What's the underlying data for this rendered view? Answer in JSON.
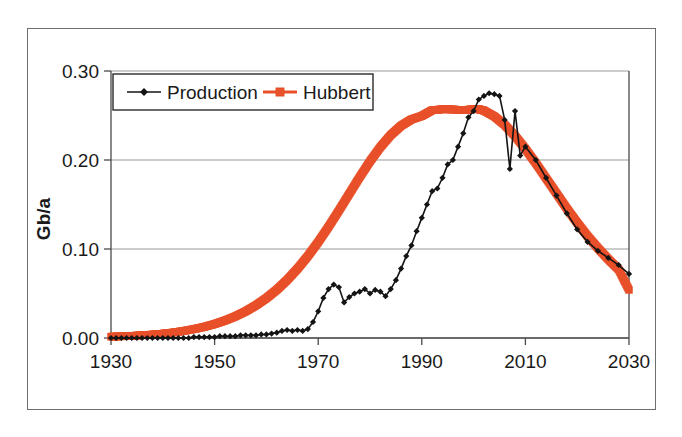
{
  "chart_data": {
    "type": "line",
    "title": "",
    "xlabel": "",
    "ylabel": "Gb/a",
    "xlim": [
      1930,
      2030
    ],
    "ylim": [
      0.0,
      0.3
    ],
    "grid": true,
    "legend_position": "top-left-inside",
    "x_ticks": [
      "1930",
      "1950",
      "1970",
      "1990",
      "2010",
      "2030"
    ],
    "x_tick_values": [
      1930,
      1950,
      1970,
      1990,
      2010,
      2030
    ],
    "y_ticks": [
      "0.00",
      "0.10",
      "0.20",
      "0.30"
    ],
    "y_tick_values": [
      0.0,
      0.1,
      0.2,
      0.3
    ],
    "colors": {
      "production": "#141414",
      "hubbert": "#e8502a",
      "grid": "#9a9a9a",
      "axis": "#4a4a4a",
      "frame": "#6e6e6e"
    },
    "series": [
      {
        "name": "Production",
        "marker": "diamond",
        "color": "#141414",
        "x": [
          1930,
          1931,
          1932,
          1933,
          1934,
          1935,
          1936,
          1937,
          1938,
          1939,
          1940,
          1941,
          1942,
          1943,
          1944,
          1945,
          1946,
          1947,
          1948,
          1949,
          1950,
          1951,
          1952,
          1953,
          1954,
          1955,
          1956,
          1957,
          1958,
          1959,
          1960,
          1961,
          1962,
          1963,
          1964,
          1965,
          1966,
          1967,
          1968,
          1969,
          1970,
          1971,
          1972,
          1973,
          1974,
          1975,
          1976,
          1977,
          1978,
          1979,
          1980,
          1981,
          1982,
          1983,
          1984,
          1985,
          1986,
          1987,
          1988,
          1989,
          1990,
          1991,
          1992,
          1993,
          1994,
          1995,
          1996,
          1997,
          1998,
          1999,
          2000,
          2001,
          2002,
          2003,
          2004,
          2005,
          2006,
          2007,
          2008,
          2009,
          2010,
          2012,
          2014,
          2016,
          2018,
          2020,
          2022,
          2024,
          2026,
          2028,
          2030
        ],
        "values": [
          0.0,
          0.0,
          0.0,
          0.0,
          0.0,
          0.0,
          0.0,
          0.0,
          0.0,
          0.0,
          0.0,
          0.0,
          0.0,
          0.0,
          0.0,
          0.0,
          0.001,
          0.001,
          0.001,
          0.001,
          0.001,
          0.002,
          0.002,
          0.002,
          0.002,
          0.003,
          0.003,
          0.003,
          0.003,
          0.004,
          0.004,
          0.005,
          0.006,
          0.008,
          0.009,
          0.008,
          0.009,
          0.008,
          0.01,
          0.018,
          0.03,
          0.045,
          0.055,
          0.06,
          0.057,
          0.04,
          0.046,
          0.05,
          0.052,
          0.055,
          0.05,
          0.054,
          0.052,
          0.047,
          0.055,
          0.065,
          0.078,
          0.092,
          0.104,
          0.12,
          0.135,
          0.15,
          0.165,
          0.168,
          0.18,
          0.195,
          0.2,
          0.215,
          0.23,
          0.248,
          0.255,
          0.268,
          0.272,
          0.275,
          0.274,
          0.272,
          0.245,
          0.19,
          0.255,
          0.205,
          0.215,
          0.2,
          0.18,
          0.16,
          0.14,
          0.122,
          0.108,
          0.098,
          0.09,
          0.082,
          0.072
        ]
      },
      {
        "name": "Hubbert",
        "marker": "square",
        "color": "#e8502a",
        "x": [
          1930,
          1932,
          1934,
          1936,
          1938,
          1940,
          1942,
          1944,
          1946,
          1948,
          1950,
          1952,
          1954,
          1956,
          1958,
          1960,
          1962,
          1964,
          1966,
          1968,
          1970,
          1972,
          1974,
          1976,
          1978,
          1980,
          1982,
          1984,
          1986,
          1988,
          1990,
          1992,
          1994,
          1996,
          1998,
          2000,
          2001,
          2002,
          2004,
          2006,
          2008,
          2010,
          2012,
          2014,
          2016,
          2018,
          2020,
          2022,
          2024,
          2026,
          2028,
          2030
        ],
        "values": [
          0.0015,
          0.0019,
          0.0024,
          0.0031,
          0.0039,
          0.0049,
          0.0062,
          0.0079,
          0.01,
          0.0125,
          0.0157,
          0.0196,
          0.0243,
          0.03,
          0.0368,
          0.0448,
          0.0542,
          0.0652,
          0.0778,
          0.092,
          0.1078,
          0.125,
          0.1432,
          0.162,
          0.1807,
          0.1985,
          0.2145,
          0.228,
          0.2385,
          0.2456,
          0.2495,
          0.256,
          0.257,
          0.2568,
          0.256,
          0.2572,
          0.257,
          0.2555,
          0.249,
          0.2395,
          0.227,
          0.2125,
          0.1965,
          0.1795,
          0.1625,
          0.1455,
          0.1295,
          0.1145,
          0.101,
          0.0885,
          0.077,
          0.054
        ]
      }
    ]
  },
  "legend": {
    "items": [
      {
        "label": "Production",
        "marker": "diamond",
        "color": "#141414"
      },
      {
        "label": "Hubbert",
        "marker": "square",
        "color": "#e8502a"
      }
    ]
  },
  "axes": {
    "y_title": "Gb/a"
  }
}
